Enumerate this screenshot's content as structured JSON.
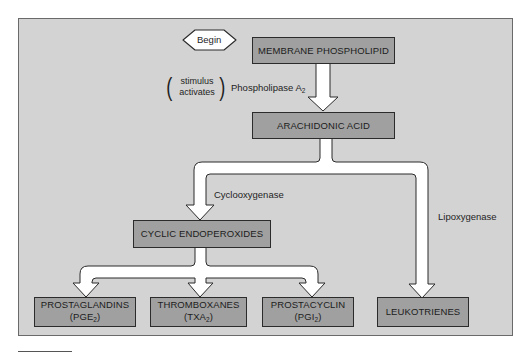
{
  "diagram": {
    "type": "flowchart",
    "title": "",
    "start": {
      "label": "Begin"
    },
    "nodes": {
      "membrane": {
        "label": "MEMBRANE PHOSPHOLIPID"
      },
      "arachidonic": {
        "label": "ARACHIDONIC ACID"
      },
      "cyclic": {
        "label": "CYCLIC ENDOPEROXIDES"
      },
      "prostaglandins": {
        "label": "PROSTAGLANDINS",
        "abbr_prefix": "(PGE",
        "abbr_sub": "2",
        "abbr_suffix": ")"
      },
      "thromboxanes": {
        "label": "THROMBOXANES",
        "abbr_prefix": "(TXA",
        "abbr_sub": "2",
        "abbr_suffix": ")"
      },
      "prostacyclin": {
        "label": "PROSTACYCLIN",
        "abbr_prefix": "(PGI",
        "abbr_sub": "2",
        "abbr_suffix": ")"
      },
      "leukotrienes": {
        "label": "LEUKOTRIENES"
      }
    },
    "edges": {
      "phospholipase": {
        "prefix": "Phospholipase A",
        "sub": "2",
        "note_line1": "stimulus",
        "note_line2": "activates"
      },
      "cyclooxygenase": {
        "label": "Cyclooxygenase"
      },
      "lipoxygenase": {
        "label": "Lipoxygenase"
      }
    },
    "colors": {
      "panel_bg": "#d3d3d3",
      "box_fill": "#a0a0a0",
      "box_border": "#2b2b2b",
      "arrow_fill": "#ffffff"
    }
  }
}
